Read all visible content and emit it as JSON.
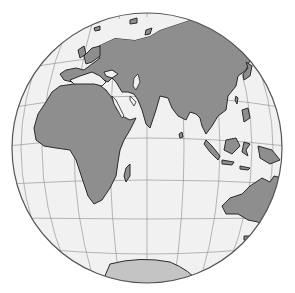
{
  "map": {
    "type": "orthographic-globe",
    "description": "Orthographic projection globe centered on the Indian Ocean / Eastern Hemisphere",
    "center_px": [
      147,
      148
    ],
    "radius_px": 135,
    "colors": {
      "ocean": "#f1f1f1",
      "land": "#8e8e8e",
      "antarctica": "#c4c4c4",
      "outline": "#2a2a2a",
      "graticule": "#9a9a9a",
      "background": "#ffffff"
    },
    "regions_visible": [
      "Europe",
      "Africa",
      "Asia",
      "Arabian Peninsula",
      "India",
      "Southeast Asia",
      "Indonesia",
      "Australia",
      "Antarctica",
      "Madagascar",
      "Japan"
    ]
  }
}
